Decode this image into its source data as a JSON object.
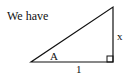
{
  "text": {
    "intro": "We have"
  },
  "diagram": {
    "type": "right-triangle",
    "labels": {
      "angle": "A",
      "base": "1",
      "height": "x"
    },
    "right_angle_marker": true,
    "colors": {
      "stroke": "#111111",
      "background": "#ffffff"
    }
  }
}
